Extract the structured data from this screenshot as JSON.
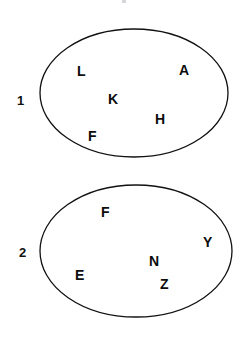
{
  "canvas": {
    "width": 248,
    "height": 341,
    "background_color": "#ffffff",
    "stroke_color": "#111111",
    "text_color": "#0d0d0d"
  },
  "diagram": {
    "type": "set-diagram",
    "title": "",
    "sets": [
      {
        "id": "set-1",
        "label": "1",
        "label_x": 17,
        "label_y": 94,
        "ellipse": {
          "cx": 134,
          "cy": 93,
          "rx": 94,
          "ry": 64
        },
        "members": [
          {
            "text": "L",
            "x": 77,
            "y": 64
          },
          {
            "text": "A",
            "x": 179,
            "y": 63
          },
          {
            "text": "K",
            "x": 108,
            "y": 92
          },
          {
            "text": "H",
            "x": 155,
            "y": 112
          },
          {
            "text": "F",
            "x": 88,
            "y": 129
          }
        ]
      },
      {
        "id": "set-2",
        "label": "2",
        "label_x": 19,
        "label_y": 246,
        "ellipse": {
          "cx": 136,
          "cy": 251,
          "rx": 96,
          "ry": 66
        },
        "members": [
          {
            "text": "F",
            "x": 101,
            "y": 205
          },
          {
            "text": "Y",
            "x": 203,
            "y": 235
          },
          {
            "text": "N",
            "x": 149,
            "y": 254
          },
          {
            "text": "E",
            "x": 75,
            "y": 268
          },
          {
            "text": "Z",
            "x": 160,
            "y": 277
          }
        ]
      }
    ]
  }
}
